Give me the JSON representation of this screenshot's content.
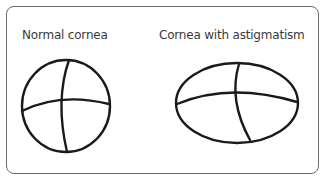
{
  "panels": [
    {
      "label": "Normal cornea",
      "shape": "circle"
    },
    {
      "label": "Cornea with astigmatism",
      "shape": "ellipse"
    }
  ],
  "colors": {
    "stroke": "#1a1a1a",
    "border": "#6a6a6a",
    "text": "#3a3a3a"
  }
}
